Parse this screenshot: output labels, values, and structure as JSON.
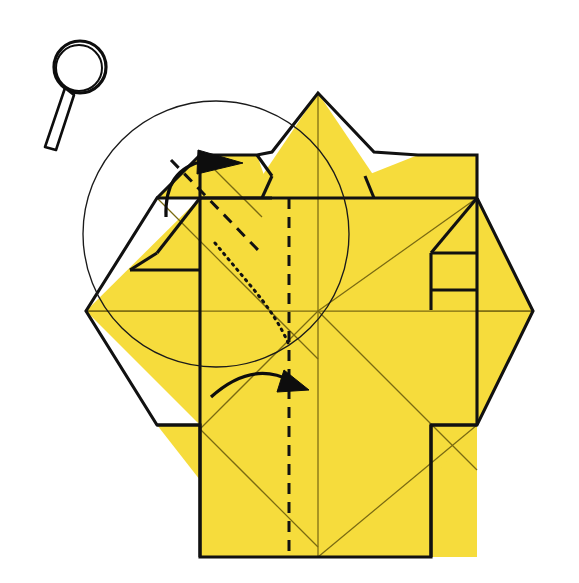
{
  "figure": {
    "background_color": "#ffffff",
    "paper_color": "#F6DC3C",
    "line_color": "#111111",
    "minor_crease_color": "#7a6a12",
    "canvas": {
      "width": 579,
      "height": 583
    }
  },
  "magnifier": {
    "label": "magnifying glass symbol",
    "lens_center": [
      80,
      67
    ],
    "lens_radius": 26,
    "handle_from": [
      62,
      87
    ],
    "handle_to": [
      47,
      147
    ]
  },
  "guide_circle": {
    "label": "construction circle",
    "center": [
      216,
      234
    ],
    "radius": 133
  },
  "arrows": [
    {
      "name": "upper-fold-arrow",
      "direction": "up-right",
      "tip": [
        237,
        163
      ],
      "tail": [
        168,
        212
      ],
      "description": "fold the upper left flap over to the right"
    },
    {
      "name": "lower-fold-arrow",
      "direction": "right-down",
      "tip": [
        305,
        387
      ],
      "tail": [
        212,
        396
      ],
      "description": "fold the lower left flap over to the right"
    }
  ],
  "creases": {
    "valley_label": "valley fold (dashed)",
    "hidden_label": "hidden edge (dotted)",
    "valley_line": [
      [
        289,
        198
      ],
      [
        289,
        557
      ]
    ],
    "hidden_line": [
      [
        213,
        241
      ],
      [
        289,
        330
      ]
    ]
  },
  "paper_outline": {
    "label": "outer silhouette of folded paper",
    "points": [
      [
        200,
        198
      ],
      [
        200,
        155
      ],
      [
        257,
        155
      ],
      [
        272,
        152
      ],
      [
        318,
        93
      ],
      [
        374,
        152
      ],
      [
        418,
        155
      ],
      [
        477,
        155
      ],
      [
        477,
        198
      ],
      [
        533,
        311
      ],
      [
        477,
        425
      ],
      [
        431,
        425
      ],
      [
        431,
        557
      ],
      [
        200,
        557
      ],
      [
        200,
        425
      ],
      [
        157,
        425
      ],
      [
        86,
        311
      ],
      [
        157,
        198
      ]
    ]
  },
  "labels": {
    "paper_region": "yellow paper surface",
    "fold_lines": "fold and edge lines"
  }
}
